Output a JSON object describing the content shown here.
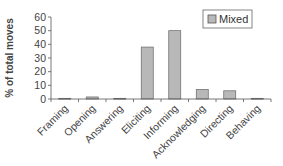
{
  "chart_data": {
    "type": "bar",
    "title": "",
    "xlabel": "",
    "ylabel": "% of total moves",
    "ylim": [
      0,
      60
    ],
    "yticks": [
      0,
      10,
      20,
      30,
      40,
      50,
      60
    ],
    "grid": false,
    "legend_position": "top-right",
    "categories": [
      "Framing",
      "Opening",
      "Answering",
      "Eliciting",
      "Informing",
      "Acknowledging",
      "Directing",
      "Behaving"
    ],
    "series": [
      {
        "name": "Mixed",
        "color": "#b8b8b8",
        "values": [
          0.5,
          1.5,
          0.5,
          38,
          50,
          7,
          6,
          0.5
        ]
      }
    ]
  },
  "legend": {
    "label": "Mixed"
  },
  "axis": {
    "ylabel": "% of total moves"
  }
}
